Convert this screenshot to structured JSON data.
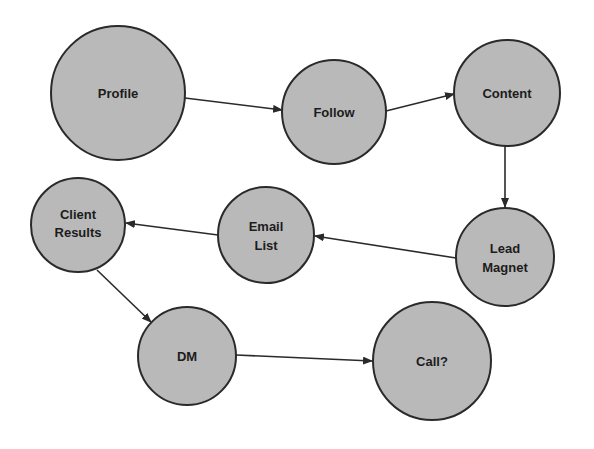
{
  "diagram": {
    "type": "flowchart",
    "colors": {
      "node_fill": "#b9b9b9",
      "node_stroke": "#2a2a2a",
      "edge": "#2a2a2a",
      "text": "#1c1c1c",
      "background": "#ffffff"
    },
    "nodes": [
      {
        "id": "profile",
        "lines": [
          "Profile"
        ],
        "cx": 118,
        "cy": 93,
        "r": 67
      },
      {
        "id": "follow",
        "lines": [
          "Follow"
        ],
        "cx": 334,
        "cy": 112,
        "r": 52
      },
      {
        "id": "content",
        "lines": [
          "Content"
        ],
        "cx": 507,
        "cy": 93,
        "r": 53
      },
      {
        "id": "lead-magnet",
        "lines": [
          "Lead",
          "Magnet"
        ],
        "cx": 505,
        "cy": 257,
        "r": 49
      },
      {
        "id": "email-list",
        "lines": [
          "Email",
          "List"
        ],
        "cx": 266,
        "cy": 235,
        "r": 48
      },
      {
        "id": "client-results",
        "lines": [
          "Client",
          "Results"
        ],
        "cx": 78,
        "cy": 225,
        "r": 47
      },
      {
        "id": "dm",
        "lines": [
          "DM"
        ],
        "cx": 187,
        "cy": 356,
        "r": 49
      },
      {
        "id": "call",
        "lines": [
          "Call?"
        ],
        "cx": 432,
        "cy": 361,
        "r": 59
      }
    ],
    "edges": [
      {
        "from": "profile",
        "to": "follow",
        "x1": 185,
        "y1": 98,
        "x2": 282,
        "y2": 110
      },
      {
        "from": "follow",
        "to": "content",
        "x1": 386,
        "y1": 111,
        "x2": 454,
        "y2": 94
      },
      {
        "from": "content",
        "to": "lead-magnet",
        "x1": 505,
        "y1": 146,
        "x2": 505,
        "y2": 207
      },
      {
        "from": "lead-magnet",
        "to": "email-list",
        "x1": 456,
        "y1": 258,
        "x2": 315,
        "y2": 236
      },
      {
        "from": "email-list",
        "to": "client-results",
        "x1": 218,
        "y1": 235,
        "x2": 126,
        "y2": 223
      },
      {
        "from": "client-results",
        "to": "dm",
        "x1": 97,
        "y1": 270,
        "x2": 151,
        "y2": 322
      },
      {
        "from": "dm",
        "to": "call",
        "x1": 236,
        "y1": 355,
        "x2": 372,
        "y2": 361
      }
    ]
  },
  "labels": {
    "profile": "Profile",
    "follow": "Follow",
    "content": "Content",
    "lead_magnet_1": "Lead",
    "lead_magnet_2": "Magnet",
    "email_list_1": "Email",
    "email_list_2": "List",
    "client_results_1": "Client",
    "client_results_2": "Results",
    "dm": "DM",
    "call": "Call?"
  }
}
